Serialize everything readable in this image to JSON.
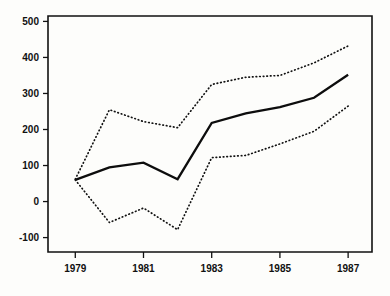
{
  "chart_data": {
    "type": "line",
    "title": "",
    "subtitle": "",
    "xlabel": "",
    "ylabel": "",
    "x": [
      1979,
      1980,
      1981,
      1982,
      1983,
      1984,
      1985,
      1986,
      1987
    ],
    "xlim": [
      1978.2,
      1987.7
    ],
    "ylim": [
      -140,
      515
    ],
    "xticks": [
      1979,
      1981,
      1983,
      1985,
      1987
    ],
    "xtick_labels": [
      "1979",
      "1981",
      "1983",
      "1985",
      "1987"
    ],
    "yticks": [
      -100,
      0,
      100,
      200,
      300,
      400,
      500
    ],
    "ytick_labels": [
      "-100",
      "0",
      "100",
      "200",
      "300",
      "400",
      "500"
    ],
    "grid": false,
    "legend": "none",
    "series": [
      {
        "name": "central-estimate",
        "style": "solid",
        "color": "#0d0d0d",
        "values": [
          60,
          95,
          108,
          62,
          218,
          245,
          262,
          288,
          352
        ]
      },
      {
        "name": "upper-bound",
        "style": "dotted",
        "color": "#121212",
        "values": [
          62,
          255,
          222,
          205,
          325,
          345,
          350,
          385,
          432
        ]
      },
      {
        "name": "lower-bound",
        "style": "dotted",
        "color": "#121212",
        "values": [
          60,
          -58,
          -18,
          -78,
          122,
          128,
          160,
          195,
          265
        ]
      }
    ]
  },
  "axes": {
    "y_tick_labels": [
      "500",
      "400",
      "300",
      "200",
      "100",
      "0",
      "-100"
    ],
    "x_tick_labels": [
      "1979",
      "1981",
      "1983",
      "1985",
      "1987"
    ]
  }
}
